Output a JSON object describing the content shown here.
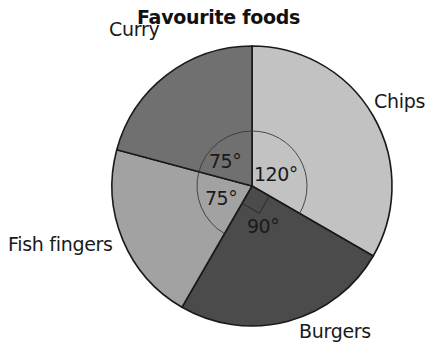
{
  "chart_data": {
    "type": "pie",
    "title": "Favourite foods",
    "categories": [
      "Chips",
      "Burgers",
      "Fish fingers",
      "Curry"
    ],
    "values": [
      120,
      90,
      75,
      75
    ],
    "units": "degrees",
    "angle_labels": [
      "120°",
      "90°",
      "75°",
      "75°"
    ],
    "colors": [
      "#c2c2c2",
      "#4b4b4b",
      "#a2a2a2",
      "#707070"
    ],
    "start_angle": "top, clockwise",
    "legend": "none (slice labels placed outside)"
  },
  "title": "Favourite foods",
  "labels": {
    "chips": "Chips",
    "burgers": "Burgers",
    "fish_fingers": "Fish fingers",
    "curry": "Curry"
  },
  "angles": {
    "chips": "120°",
    "burgers": "90°",
    "fish_fingers": "75°",
    "curry": "75°"
  }
}
